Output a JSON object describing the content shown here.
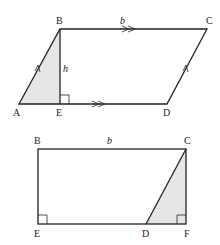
{
  "figures": [
    {
      "name": "parallelogram",
      "vertices": {
        "A": {
          "label": "A",
          "x": 19,
          "y": 104
        },
        "B": {
          "label": "B",
          "x": 60,
          "y": 29
        },
        "C": {
          "label": "C",
          "x": 207,
          "y": 29
        },
        "D": {
          "label": "D",
          "x": 167,
          "y": 104
        },
        "E": {
          "label": "E",
          "x": 60,
          "y": 104
        }
      },
      "labels": {
        "base": "b",
        "height": "h"
      },
      "shaded_region": "triangle ABE",
      "markers": [
        "single arrow on AB",
        "single arrow on DC",
        "double arrow on BC",
        "double arrow on AD",
        "right angle at E"
      ]
    },
    {
      "name": "rectangle",
      "vertices": {
        "B": {
          "label": "B",
          "x": 38,
          "y": 149
        },
        "C": {
          "label": "C",
          "x": 186,
          "y": 149
        },
        "D": {
          "label": "D",
          "x": 146,
          "y": 224
        },
        "E": {
          "label": "E",
          "x": 38,
          "y": 224
        },
        "F": {
          "label": "F",
          "x": 186,
          "y": 224
        }
      },
      "labels": {
        "base": "b"
      },
      "shaded_region": "triangle DCF",
      "markers": [
        "right angle at E",
        "right angle at F"
      ]
    }
  ],
  "colors": {
    "line": "#222222",
    "shade": "#e6e6e6"
  }
}
